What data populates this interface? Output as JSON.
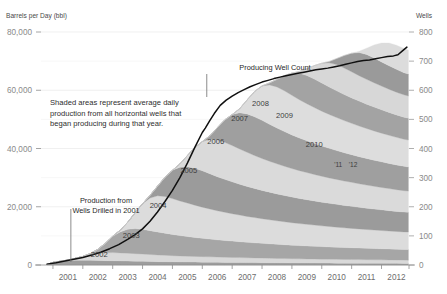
{
  "chart_data": {
    "type": "area",
    "title": "",
    "ylabel": "Barrels per Day (bbl)",
    "y2label": "Wells",
    "xlabel": "",
    "ylim": [
      0,
      80000
    ],
    "y2lim": [
      0,
      800
    ],
    "xlim": [
      2000.6,
      2012.92
    ],
    "grid": true,
    "legend_position": "none",
    "stacked": true,
    "y_ticks": [
      "0",
      "20,000",
      "40,000",
      "60,000",
      "80,000"
    ],
    "y_tick_values": [
      0,
      20000,
      40000,
      60000,
      80000
    ],
    "y_minor_values": [
      10000,
      30000,
      50000,
      70000
    ],
    "y2_ticks": [
      "0",
      "100",
      "200",
      "300",
      "400",
      "500",
      "600",
      "700",
      "800"
    ],
    "y2_tick_values": [
      0,
      100,
      200,
      300,
      400,
      500,
      600,
      700,
      800
    ],
    "x_ticks": [
      "2001",
      "2002",
      "2003",
      "2004",
      "2005",
      "2006",
      "2007",
      "2008",
      "2009",
      "2010",
      "2011",
      "2012"
    ],
    "x_tick_values": [
      2001,
      2002,
      2003,
      2004,
      2005,
      2006,
      2007,
      2008,
      2009,
      2010,
      2011,
      2012
    ],
    "annotations": [
      {
        "name": "shaded-areas-note",
        "lines": [
          "Shaded areas represent average daily",
          "production from all horizontal wells that",
          "began producing during that year."
        ]
      },
      {
        "name": "production-2001-callout",
        "lines": [
          "Production from",
          "Wells Drilled in 2001"
        ],
        "points_to_x": 2001.6
      },
      {
        "name": "producing-well-count-callout",
        "lines": [
          "Producing Well Count"
        ],
        "points_to_x": 2006.15
      }
    ],
    "band_labels": [
      {
        "label": "2002",
        "x": 2002.55,
        "value": 2600
      },
      {
        "label": "2003",
        "x": 2003.62,
        "value": 9200
      },
      {
        "label": "2004",
        "x": 2004.52,
        "value": 19500
      },
      {
        "label": "2005",
        "x": 2005.55,
        "value": 31500
      },
      {
        "label": "2006",
        "x": 2006.45,
        "value": 41500
      },
      {
        "label": "2007",
        "x": 2007.25,
        "value": 49500
      },
      {
        "label": "2008",
        "x": 2007.95,
        "value": 54500
      },
      {
        "label": "2009",
        "x": 2008.75,
        "value": 50500
      },
      {
        "label": "2010",
        "x": 2009.75,
        "value": 40500
      },
      {
        "label": "'11",
        "x": 2010.55,
        "value": 33500
      },
      {
        "label": "'12",
        "x": 2011.05,
        "value": 33500
      }
    ],
    "x": [
      2000.8,
      2001.0,
      2001.25,
      2001.5,
      2001.75,
      2002.0,
      2002.25,
      2002.5,
      2002.75,
      2003.0,
      2003.25,
      2003.5,
      2003.75,
      2004.0,
      2004.25,
      2004.5,
      2004.75,
      2005.0,
      2005.25,
      2005.5,
      2005.75,
      2006.0,
      2006.25,
      2006.5,
      2006.75,
      2007.0,
      2007.25,
      2007.5,
      2007.75,
      2008.0,
      2008.25,
      2008.5,
      2008.75,
      2009.0,
      2009.25,
      2009.5,
      2009.75,
      2010.0,
      2010.25,
      2010.5,
      2010.75,
      2011.0,
      2011.25,
      2011.5,
      2011.75,
      2012.0,
      2012.25,
      2012.5,
      2012.75,
      2012.9
    ],
    "series": [
      {
        "name": "2001",
        "color": "#9d9d9d",
        "values": [
          200,
          900,
          1300,
          1500,
          1600,
          1650,
          1600,
          1550,
          1500,
          1450,
          1400,
          1350,
          1300,
          1250,
          1200,
          1150,
          1120,
          1080,
          1050,
          1020,
          1000,
          970,
          950,
          930,
          900,
          880,
          860,
          840,
          820,
          800,
          780,
          760,
          740,
          720,
          700,
          690,
          680,
          660,
          650,
          640,
          630,
          620,
          610,
          600,
          590,
          580,
          570,
          560,
          550,
          545
        ]
      },
      {
        "name": "2002",
        "color": "#d9d9d9",
        "values": [
          0,
          0,
          0,
          200,
          700,
          1300,
          1900,
          2400,
          2700,
          2800,
          2750,
          2700,
          2600,
          2500,
          2400,
          2300,
          2200,
          2120,
          2050,
          2000,
          1950,
          1900,
          1850,
          1800,
          1760,
          1720,
          1680,
          1640,
          1600,
          1570,
          1540,
          1500,
          1470,
          1440,
          1410,
          1390,
          1370,
          1340,
          1320,
          1300,
          1280,
          1260,
          1240,
          1220,
          1200,
          1180,
          1160,
          1140,
          1130,
          1125
        ]
      },
      {
        "name": "2003",
        "color": "#a6a6a6",
        "values": [
          0,
          0,
          0,
          0,
          0,
          0,
          400,
          1400,
          3200,
          5600,
          7200,
          8200,
          8600,
          8500,
          8200,
          7900,
          7600,
          7300,
          7000,
          6750,
          6500,
          6300,
          6100,
          5900,
          5750,
          5600,
          5450,
          5300,
          5180,
          5060,
          4950,
          4840,
          4740,
          4640,
          4550,
          4470,
          4390,
          4310,
          4240,
          4170,
          4100,
          4040,
          3980,
          3920,
          3870,
          3820,
          3770,
          3720,
          3680,
          3660
        ]
      },
      {
        "name": "2004",
        "color": "#dcdcdc",
        "values": [
          0,
          0,
          0,
          0,
          0,
          0,
          0,
          0,
          0,
          0,
          600,
          2400,
          5400,
          8800,
          11200,
          12400,
          12600,
          12300,
          11900,
          11500,
          11100,
          10700,
          10350,
          10000,
          9700,
          9400,
          9150,
          8900,
          8680,
          8460,
          8260,
          8070,
          7890,
          7720,
          7560,
          7410,
          7270,
          7130,
          7000,
          6880,
          6760,
          6650,
          6540,
          6440,
          6340,
          6250,
          6160,
          6080,
          6000,
          5970
        ]
      },
      {
        "name": "2005",
        "color": "#9b9b9b",
        "values": [
          0,
          0,
          0,
          0,
          0,
          0,
          0,
          0,
          0,
          0,
          0,
          0,
          0,
          0,
          900,
          3300,
          6600,
          9700,
          11600,
          12500,
          12700,
          12500,
          12100,
          11700,
          11300,
          10950,
          10600,
          10300,
          10000,
          9730,
          9480,
          9250,
          9030,
          8820,
          8630,
          8450,
          8280,
          8120,
          7970,
          7830,
          7690,
          7560,
          7440,
          7320,
          7210,
          7100,
          7000,
          6900,
          6810,
          6770
        ]
      },
      {
        "name": "2006",
        "color": "#dadada",
        "values": [
          0,
          0,
          0,
          0,
          0,
          0,
          0,
          0,
          0,
          0,
          0,
          0,
          0,
          0,
          0,
          0,
          0,
          0,
          1100,
          3800,
          7100,
          10000,
          11800,
          12600,
          12700,
          12500,
          12100,
          11700,
          11300,
          10950,
          10620,
          10320,
          10040,
          9780,
          9540,
          9320,
          9110,
          8910,
          8730,
          8560,
          8390,
          8240,
          8090,
          7950,
          7820,
          7690,
          7570,
          7460,
          7350,
          7300
        ]
      },
      {
        "name": "2007",
        "color": "#9f9f9f",
        "values": [
          0,
          0,
          0,
          0,
          0,
          0,
          0,
          0,
          0,
          0,
          0,
          0,
          0,
          0,
          0,
          0,
          0,
          0,
          0,
          0,
          0,
          0,
          1200,
          4200,
          7700,
          10600,
          12400,
          13200,
          13300,
          13100,
          12700,
          12300,
          11900,
          11550,
          11220,
          10920,
          10640,
          10380,
          10140,
          9910,
          9700,
          9500,
          9310,
          9130,
          8960,
          8800,
          8650,
          8500,
          8370,
          8310
        ]
      },
      {
        "name": "2008",
        "color": "#dddddd",
        "values": [
          0,
          0,
          0,
          0,
          0,
          0,
          0,
          0,
          0,
          0,
          0,
          0,
          0,
          0,
          0,
          0,
          0,
          0,
          0,
          0,
          0,
          0,
          0,
          0,
          0,
          0,
          1400,
          4800,
          8700,
          11800,
          13500,
          14100,
          14000,
          13600,
          13150,
          12720,
          12330,
          11970,
          11640,
          11330,
          11040,
          10770,
          10520,
          10280,
          10060,
          9850,
          9650,
          9460,
          9290,
          9220
        ]
      },
      {
        "name": "2009",
        "color": "#a3a3a3",
        "values": [
          0,
          0,
          0,
          0,
          0,
          0,
          0,
          0,
          0,
          0,
          0,
          0,
          0,
          0,
          0,
          0,
          0,
          0,
          0,
          0,
          0,
          0,
          0,
          0,
          0,
          0,
          0,
          0,
          0,
          0,
          700,
          2600,
          5200,
          7600,
          9100,
          9700,
          9800,
          9650,
          9420,
          9180,
          8950,
          8740,
          8540,
          8350,
          8180,
          8010,
          7860,
          7710,
          7580,
          7520
        ]
      },
      {
        "name": "2010",
        "color": "#d7d7d7",
        "values": [
          0,
          0,
          0,
          0,
          0,
          0,
          0,
          0,
          0,
          0,
          0,
          0,
          0,
          0,
          0,
          0,
          0,
          0,
          0,
          0,
          0,
          0,
          0,
          0,
          0,
          0,
          0,
          0,
          0,
          0,
          0,
          0,
          0,
          0,
          600,
          2300,
          4600,
          6800,
          8300,
          9000,
          9100,
          8950,
          8750,
          8540,
          8340,
          8150,
          7970,
          7810,
          7660,
          7600
        ]
      },
      {
        "name": "2011",
        "color": "#9a9a9a",
        "values": [
          0,
          0,
          0,
          0,
          0,
          0,
          0,
          0,
          0,
          0,
          0,
          0,
          0,
          0,
          0,
          0,
          0,
          0,
          0,
          0,
          0,
          0,
          0,
          0,
          0,
          0,
          0,
          0,
          0,
          0,
          0,
          0,
          0,
          0,
          0,
          0,
          0,
          0,
          500,
          2100,
          4300,
          6400,
          7900,
          8500,
          8500,
          8300,
          8060,
          7830,
          7620,
          7540
        ]
      },
      {
        "name": "2012",
        "color": "#dcdcdc",
        "values": [
          0,
          0,
          0,
          0,
          0,
          0,
          0,
          0,
          0,
          0,
          0,
          0,
          0,
          0,
          0,
          0,
          0,
          0,
          0,
          0,
          0,
          0,
          0,
          0,
          0,
          0,
          0,
          0,
          0,
          0,
          0,
          0,
          0,
          0,
          0,
          0,
          0,
          0,
          0,
          0,
          0,
          0,
          500,
          2200,
          4500,
          6500,
          7800,
          8300,
          8300,
          8250
        ]
      }
    ],
    "line_series": {
      "name": "Producing Well Count",
      "color": "#101010",
      "axis": "right",
      "x": [
        2000.8,
        2001.1,
        2001.4,
        2001.7,
        2002.0,
        2002.3,
        2002.6,
        2002.9,
        2003.2,
        2003.5,
        2003.75,
        2004.0,
        2004.25,
        2004.5,
        2004.75,
        2005.0,
        2005.25,
        2005.5,
        2005.75,
        2006.0,
        2006.1,
        2006.25,
        2006.4,
        2006.6,
        2006.8,
        2007.0,
        2007.2,
        2007.4,
        2007.6,
        2007.8,
        2008.0,
        2008.2,
        2008.4,
        2008.6,
        2008.8,
        2009.0,
        2009.2,
        2009.4,
        2009.6,
        2009.8,
        2010.0,
        2010.2,
        2010.4,
        2010.6,
        2010.8,
        2011.0,
        2011.2,
        2011.4,
        2011.6,
        2011.8,
        2012.0,
        2012.2,
        2012.4,
        2012.55,
        2012.7,
        2012.85
      ],
      "values": [
        3,
        8,
        14,
        20,
        26,
        34,
        44,
        56,
        70,
        88,
        104,
        124,
        150,
        182,
        218,
        256,
        300,
        350,
        404,
        455,
        470,
        496,
        520,
        548,
        566,
        580,
        592,
        602,
        612,
        620,
        628,
        634,
        640,
        645,
        650,
        654,
        658,
        662,
        666,
        670,
        673,
        676,
        680,
        684,
        689,
        694,
        699,
        702,
        704,
        708,
        712,
        716,
        718,
        722,
        735,
        748
      ]
    }
  }
}
